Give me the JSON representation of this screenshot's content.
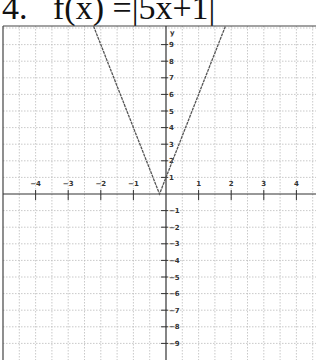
{
  "problem": {
    "number": "4.",
    "function_label": "f(x) =|5x+1|"
  },
  "chart_data": {
    "type": "line",
    "function": "f(x) = |5x+1|",
    "xlabel": "",
    "ylabel": "y",
    "xlim": [
      -4.9,
      4.6
    ],
    "ylim": [
      -10,
      10.1
    ],
    "grid": true,
    "x_ticks": [
      -4,
      -3,
      -2,
      -1,
      1,
      2,
      3,
      4
    ],
    "y_ticks": [
      9,
      8,
      7,
      6,
      5,
      4,
      3,
      2,
      1,
      -1,
      -2,
      -3,
      -4,
      -5,
      -6,
      -7,
      -8,
      -9
    ],
    "series": [
      {
        "name": "f(x) = |5x+1|",
        "x": [
          -2.22,
          -2,
          -1.8,
          -1,
          -0.2,
          0,
          1,
          1.8,
          1.82
        ],
        "y": [
          10.1,
          9,
          8,
          4,
          0,
          1,
          6,
          10,
          10.1
        ]
      }
    ],
    "vertex": [
      -0.2,
      0
    ],
    "y_intercept": [
      0,
      1
    ],
    "line_color": "#555555",
    "axis_color": "#333333",
    "grid_color": "#bbbbbb"
  }
}
